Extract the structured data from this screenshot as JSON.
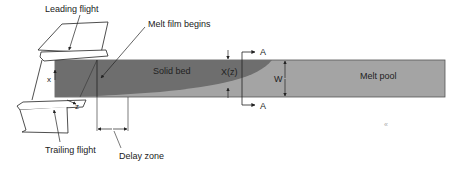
{
  "diagram": {
    "labels": {
      "leading_flight": "Leading flight",
      "trailing_flight": "Trailing flight",
      "melt_film_begins": "Melt film begins",
      "delay_zone": "Delay zone",
      "solid_bed": "Solid bed",
      "melt_pool": "Melt pool",
      "x_of_z": "X(z)",
      "width": "W",
      "section_top": "A",
      "section_bottom": "A",
      "axis_x": "x",
      "axis_z": "z"
    },
    "colors": {
      "solid_bed": "#6e6e6e",
      "melt_pool": "#a4a4a4",
      "outline": "#333333",
      "background": "#ffffff"
    }
  }
}
